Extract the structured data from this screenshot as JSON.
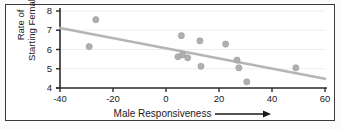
{
  "chart_data": {
    "type": "scatter",
    "title": "",
    "xlabel": "Male Responsiveness",
    "ylabel": "Rate of Starting Females",
    "ylabel_line1": "Rate of",
    "ylabel_line2": "Starting Females",
    "xlim": [
      -40,
      60
    ],
    "ylim": [
      4,
      8
    ],
    "xticks": [
      -40,
      -20,
      0,
      20,
      40,
      60
    ],
    "yticks": [
      4,
      5,
      6,
      7,
      8
    ],
    "xtick_labels": [
      "-40",
      "-20",
      "0",
      "20",
      "40",
      "60"
    ],
    "ytick_labels": [
      "4",
      "5",
      "6",
      "7",
      "8"
    ],
    "grid": true,
    "grid_axis": "y",
    "legend": null,
    "xlabel_arrow": "⟶",
    "point_color": "#b0b0b0",
    "point_edge_color": "#9a9a9a",
    "line_color": "#b5b5b5",
    "axis_color": "#2b2b2b",
    "grid_color": "#eeeeee",
    "frame_color": "#3a3a3a",
    "background": "#ffffff",
    "points": [
      {
        "x": -29.0,
        "y": 6.15
      },
      {
        "x": -26.5,
        "y": 7.55
      },
      {
        "x": 4.5,
        "y": 5.62
      },
      {
        "x": 5.8,
        "y": 6.72
      },
      {
        "x": 6.2,
        "y": 5.72
      },
      {
        "x": 8.2,
        "y": 5.57
      },
      {
        "x": 12.8,
        "y": 6.45
      },
      {
        "x": 13.2,
        "y": 5.13
      },
      {
        "x": 22.5,
        "y": 6.28
      },
      {
        "x": 26.8,
        "y": 5.45
      },
      {
        "x": 27.5,
        "y": 5.05
      },
      {
        "x": 30.5,
        "y": 4.32
      },
      {
        "x": 49.0,
        "y": 5.05
      }
    ],
    "trendline": {
      "name": "regression-line",
      "x_start": -40,
      "y_start": 7.12,
      "x_end": 60,
      "y_end": 4.48
    }
  }
}
